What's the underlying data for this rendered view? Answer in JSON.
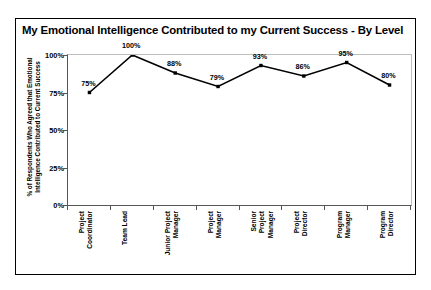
{
  "chart_data": {
    "type": "line",
    "title": "My Emotional Intelligence Contributed to my Current Success - By Level",
    "xlabel": "",
    "ylabel": "% of Respondents Who Agreed that Emotional Intelligence Contributed to Current Success",
    "categories": [
      "Project Coordinator",
      "Team Lead",
      "Junior Project Manager",
      "Project Manager",
      "Senior Project Manager",
      "Project Director",
      "Program Manager",
      "Program Director"
    ],
    "category_lines": [
      [
        "Project",
        "Coordinator"
      ],
      [
        "Team Lead"
      ],
      [
        "Junior Project",
        "Manager"
      ],
      [
        "Project",
        "Manager"
      ],
      [
        "Senior",
        "Project",
        "Manager"
      ],
      [
        "Project",
        "Director"
      ],
      [
        "Program",
        "Manager"
      ],
      [
        "Program",
        "Director"
      ]
    ],
    "values": [
      75,
      100,
      88,
      79,
      93,
      86,
      95,
      80
    ],
    "data_labels": [
      "75%",
      "100%",
      "88%",
      "79%",
      "93%",
      "86%",
      "95%",
      "80%"
    ],
    "ylim": [
      0,
      100
    ],
    "yticks": [
      0,
      25,
      50,
      75,
      100
    ],
    "ytick_labels": [
      "0%",
      "25%",
      "50%",
      "75%",
      "100%"
    ],
    "grid": false,
    "legend": "none",
    "series_color": "#000000",
    "marker": "square",
    "background_color": "#ffffff",
    "border_color": "#000000"
  }
}
